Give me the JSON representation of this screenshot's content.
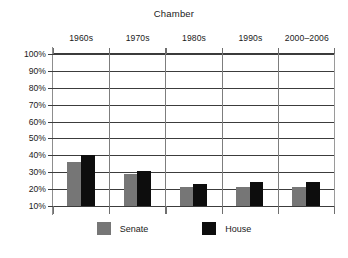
{
  "chart_data": {
    "type": "bar",
    "title": "Chamber",
    "xlabel": "",
    "ylabel": "",
    "categories": [
      "1960s",
      "1970s",
      "1980s",
      "1990s",
      "2000–2006"
    ],
    "series": [
      {
        "name": "Senate",
        "color": "#767676",
        "values": [
          36,
          29,
          21,
          21,
          21
        ]
      },
      {
        "name": "House",
        "color": "#0d0d0d",
        "values": [
          40,
          31,
          23,
          24,
          24
        ]
      }
    ],
    "ylim": [
      10,
      100
    ],
    "ytick_labels": [
      "100%",
      "90%",
      "80%",
      "70%",
      "60%",
      "50%",
      "40%",
      "30%",
      "20%",
      "10%"
    ],
    "ytick_values": [
      100,
      90,
      80,
      70,
      60,
      50,
      40,
      30,
      20,
      10
    ],
    "grid": true,
    "legend_position": "bottom",
    "category_label_position": "top"
  },
  "legend": {
    "items": [
      {
        "label": "Senate"
      },
      {
        "label": "House"
      }
    ]
  }
}
